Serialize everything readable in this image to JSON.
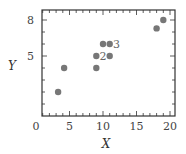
{
  "chart_data": {
    "type": "scatter",
    "title": "",
    "xlabel": "X",
    "ylabel": "Y",
    "xlim": [
      0,
      21
    ],
    "ylim": [
      0,
      9
    ],
    "x_ticks": [
      0,
      5,
      10,
      15,
      20
    ],
    "y_ticks": [
      5,
      8
    ],
    "grid": false,
    "legend": null,
    "points": [
      {
        "x": 3.3,
        "y": 2
      },
      {
        "x": 4.2,
        "y": 4
      },
      {
        "x": 9,
        "y": 4
      },
      {
        "x": 9,
        "y": 5
      },
      {
        "x": 11,
        "y": 5
      },
      {
        "x": 10,
        "y": 6
      },
      {
        "x": 11,
        "y": 6
      },
      {
        "x": 18,
        "y": 7.3
      },
      {
        "x": 19,
        "y": 8
      }
    ],
    "annotations": [
      {
        "text": "2",
        "x": 10,
        "y": 5
      },
      {
        "text": "3",
        "x": 12,
        "y": 6
      }
    ],
    "point_color": "#777777"
  }
}
